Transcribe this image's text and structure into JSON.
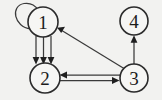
{
  "figure": {
    "kind": "directed-multigraph-diagram",
    "width": 162,
    "height": 100,
    "background_color": "#f2f2f0",
    "node_fill_color": "#f6f6f4",
    "node_stroke_color": "#2b2b2b",
    "edge_color": "#3a3a3a",
    "arrowhead_color": "#1f1f1f"
  },
  "nodes": [
    {
      "id": "1",
      "label": "1",
      "cx": 43,
      "cy": 22,
      "r": 15
    },
    {
      "id": "2",
      "label": "2",
      "cx": 45,
      "cy": 78,
      "r": 15
    },
    {
      "id": "3",
      "label": "3",
      "cx": 134,
      "cy": 78,
      "r": 14
    },
    {
      "id": "4",
      "label": "4",
      "cx": 134,
      "cy": 21,
      "r": 14
    }
  ],
  "edges": [
    {
      "id": "e-self-1",
      "from": "1",
      "to": "1",
      "kind": "self-loop",
      "multiplicity": 1
    },
    {
      "id": "e-1-2-a",
      "from": "1",
      "to": "2",
      "kind": "straight",
      "multiplicity": 1
    },
    {
      "id": "e-1-2-b",
      "from": "1",
      "to": "2",
      "kind": "straight",
      "multiplicity": 1
    },
    {
      "id": "e-1-2-c",
      "from": "1",
      "to": "2",
      "kind": "straight",
      "multiplicity": 1
    },
    {
      "id": "e-3-1",
      "from": "3",
      "to": "1",
      "kind": "diagonal",
      "multiplicity": 1
    },
    {
      "id": "e-3-2",
      "from": "3",
      "to": "2",
      "kind": "straight",
      "multiplicity": 1
    },
    {
      "id": "e-2-3",
      "from": "2",
      "to": "3",
      "kind": "straight",
      "multiplicity": 1
    },
    {
      "id": "e-3-4",
      "from": "3",
      "to": "4",
      "kind": "straight",
      "multiplicity": 1
    }
  ]
}
